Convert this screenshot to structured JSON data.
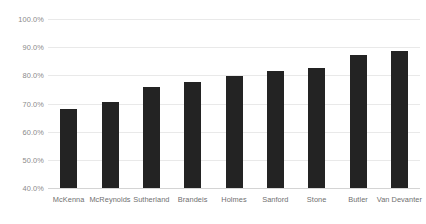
{
  "chart_data": {
    "type": "bar",
    "title": "",
    "subtitle": "",
    "xlabel": "",
    "ylabel": "",
    "ylim": [
      40,
      100
    ],
    "y_tick_step": 10,
    "grid": true,
    "legend": "none",
    "orientation": "vertical",
    "bar_color": "#232323",
    "gridline_color": "#e9e9e9",
    "axis_line_color": "#d4d4d4",
    "categories": [
      "McKenna",
      "McReynolds",
      "Sutherland",
      "Brandeis",
      "Holmes",
      "Sanford",
      "Stone",
      "Butler",
      "Van Devanter"
    ],
    "values": [
      68.0,
      70.5,
      76.0,
      77.5,
      79.8,
      81.7,
      82.7,
      87.2,
      88.5
    ],
    "y_tick_labels": [
      "100.0%",
      "90.0%",
      "80.0%",
      "70.0%",
      "60.0%",
      "50.0%",
      "40.0%"
    ],
    "y_tick_values": [
      100,
      90,
      80,
      70,
      60,
      50,
      40
    ]
  }
}
